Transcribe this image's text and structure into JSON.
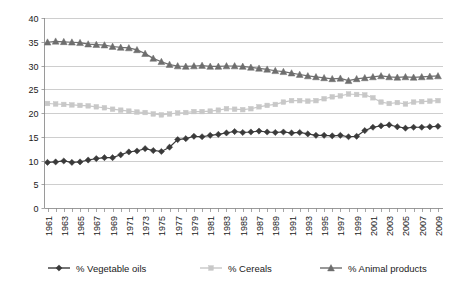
{
  "chart_data": {
    "type": "line",
    "title": "",
    "subtitle": "",
    "xlabel": "",
    "ylabel": "",
    "ylim": [
      0,
      40
    ],
    "ytick_step": 5,
    "yticks": [
      "0",
      "5",
      "10",
      "15",
      "20",
      "25",
      "30",
      "35",
      "40"
    ],
    "grid": true,
    "legend_position": "bottom",
    "x": [
      1961,
      1962,
      1963,
      1964,
      1965,
      1966,
      1967,
      1968,
      1969,
      1970,
      1971,
      1972,
      1973,
      1974,
      1975,
      1976,
      1977,
      1978,
      1979,
      1980,
      1981,
      1982,
      1983,
      1984,
      1985,
      1986,
      1987,
      1988,
      1989,
      1990,
      1991,
      1992,
      1993,
      1994,
      1995,
      1996,
      1997,
      1998,
      1999,
      2000,
      2001,
      2002,
      2003,
      2004,
      2005,
      2006,
      2007,
      2008,
      2009
    ],
    "xtick_labels": [
      "1961",
      "1963",
      "1965",
      "1967",
      "1969",
      "1971",
      "1973",
      "1975",
      "1977",
      "1979",
      "1981",
      "1983",
      "1985",
      "1987",
      "1989",
      "1991",
      "1993",
      "1995",
      "1997",
      "1999",
      "2001",
      "2003",
      "2005",
      "2007",
      "2009"
    ],
    "series": [
      {
        "name": "% Vegetable oils",
        "color": "#3a3a3a",
        "marker": "diamond",
        "values": [
          9.6,
          9.7,
          9.9,
          9.6,
          9.7,
          10.1,
          10.4,
          10.6,
          10.6,
          11.2,
          11.8,
          12.0,
          12.5,
          12.1,
          11.9,
          12.8,
          14.4,
          14.6,
          15.1,
          15.0,
          15.3,
          15.5,
          15.8,
          16.1,
          15.9,
          16.0,
          16.2,
          16.0,
          15.9,
          16.0,
          15.8,
          15.9,
          15.6,
          15.3,
          15.3,
          15.2,
          15.3,
          15.0,
          15.1,
          16.3,
          17.0,
          17.3,
          17.5,
          17.1,
          16.8,
          17.0,
          17.0,
          17.1,
          17.2
        ]
      },
      {
        "name": "% Cereals",
        "color": "#c8c8c8",
        "marker": "square",
        "values": [
          22.0,
          21.9,
          21.8,
          21.7,
          21.6,
          21.5,
          21.3,
          21.1,
          20.8,
          20.6,
          20.4,
          20.2,
          20.1,
          19.8,
          19.6,
          19.8,
          20.0,
          20.1,
          20.3,
          20.3,
          20.4,
          20.6,
          20.9,
          20.8,
          20.7,
          20.9,
          21.3,
          21.6,
          21.8,
          22.3,
          22.6,
          22.6,
          22.5,
          22.6,
          23.0,
          23.4,
          23.6,
          24.0,
          23.9,
          23.8,
          23.2,
          22.3,
          22.0,
          22.2,
          21.9,
          22.3,
          22.4,
          22.5,
          22.6
        ]
      },
      {
        "name": "% Animal products",
        "color": "#6e6e6e",
        "marker": "triangle",
        "values": [
          34.9,
          35.1,
          35.0,
          34.9,
          34.8,
          34.5,
          34.4,
          34.3,
          34.0,
          33.8,
          33.7,
          33.3,
          32.5,
          31.5,
          30.8,
          30.2,
          29.9,
          29.8,
          29.9,
          30.0,
          29.8,
          29.8,
          29.9,
          29.9,
          29.8,
          29.6,
          29.4,
          29.2,
          28.9,
          28.7,
          28.4,
          28.1,
          27.8,
          27.6,
          27.4,
          27.2,
          27.3,
          26.8,
          27.2,
          27.4,
          27.6,
          27.8,
          27.6,
          27.5,
          27.6,
          27.5,
          27.6,
          27.7,
          27.8
        ]
      }
    ]
  },
  "legend": {
    "items": [
      {
        "label": "% Vegetable oils"
      },
      {
        "label": "% Cereals"
      },
      {
        "label": "% Animal products"
      }
    ]
  },
  "colors": {
    "vegetable_oils": "#3a3a3a",
    "cereals": "#c8c8c8",
    "animal_products": "#6e6e6e",
    "gridline": "#b9b9b9",
    "axis": "#808080",
    "text": "#1a1a1a",
    "background": "#ffffff"
  }
}
